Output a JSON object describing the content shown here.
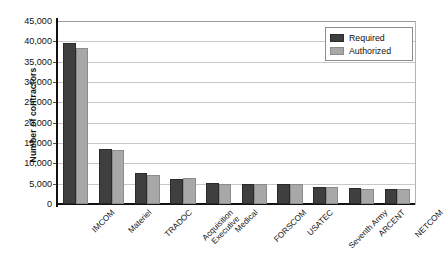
{
  "chart_data": {
    "type": "bar",
    "title": "",
    "subtitle": "",
    "xlabel": "",
    "ylabel": "Number of contractors",
    "ylim": [
      0,
      45000
    ],
    "ytick_labels": [
      "45,000",
      "40,000",
      "35,000",
      "30,000",
      "25,000",
      "20,000",
      "15,000",
      "10,000",
      "5,000",
      "0"
    ],
    "ytick_values": [
      45000,
      40000,
      35000,
      30000,
      25000,
      20000,
      15000,
      10000,
      5000,
      0
    ],
    "grid": "horizontal",
    "legend_position": "top-right",
    "categories": [
      "IMCOM",
      "Materiel",
      "TRADOC",
      "Acquisition Executive",
      "Medical",
      "FORSCOM",
      "USATEC",
      "Seventh Army",
      "ARCENT",
      "NETCOM"
    ],
    "category_lines": [
      [
        "IMCOM"
      ],
      [
        "Materiel"
      ],
      [
        "TRADOC"
      ],
      [
        "Acquisition",
        "Executive"
      ],
      [
        "Medical"
      ],
      [
        "FORSCOM"
      ],
      [
        "USATEC"
      ],
      [
        "Seventh Army"
      ],
      [
        "ARCENT"
      ],
      [
        "NETCOM"
      ]
    ],
    "series": [
      {
        "name": "Required",
        "color": "#3f3f3f",
        "values": [
          39500,
          13500,
          7600,
          6200,
          5100,
          5000,
          5000,
          4200,
          3900,
          3800
        ]
      },
      {
        "name": "Authorized",
        "color": "#a8a8a8",
        "values": [
          38300,
          13400,
          7100,
          6300,
          5000,
          4900,
          4900,
          4100,
          3800,
          3800
        ]
      }
    ]
  },
  "legend": {
    "items": [
      {
        "label": "Required",
        "swatch": "required"
      },
      {
        "label": "Authorized",
        "swatch": "authorized"
      }
    ]
  },
  "axis": {
    "y_title": "Number of contractors"
  }
}
